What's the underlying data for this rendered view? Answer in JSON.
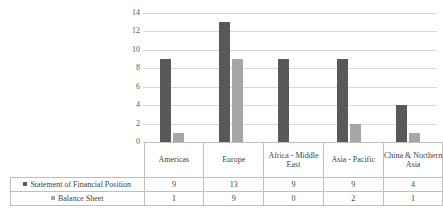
{
  "chart_data": {
    "type": "bar",
    "title": "",
    "subtitle": "",
    "xlabel": "",
    "ylabel": "",
    "categories": [
      "Americas",
      "Europe",
      "Africa - Middle East",
      "Asia - Pacific",
      "China & Northern Asia"
    ],
    "series": [
      {
        "name": "Statement of Financial Position",
        "values": [
          9,
          13,
          9,
          9,
          4
        ],
        "color": "#595959"
      },
      {
        "name": "Balance Sheet",
        "values": [
          1,
          9,
          0,
          2,
          1
        ],
        "color": "#a6a6a6"
      }
    ],
    "ylim": [
      0,
      14
    ],
    "yticks": [
      14,
      12,
      10,
      8,
      6,
      4,
      2,
      0
    ],
    "grid": true,
    "legend_position": "table-left",
    "has_data_table": true
  },
  "axis": {
    "ticks": [
      "14",
      "12",
      "10",
      "8",
      "6",
      "4",
      "2",
      "0"
    ]
  },
  "table": {
    "headers": [
      "Americas",
      "Europe",
      "Africa - Middle East",
      "Asia - Pacific",
      "China & Northern Asia"
    ],
    "rows": [
      {
        "label": "Statement of Financial Position",
        "values": [
          "9",
          "13",
          "9",
          "9",
          "4"
        ]
      },
      {
        "label": "Balance Sheet",
        "values": [
          "1",
          "9",
          "0",
          "2",
          "1"
        ]
      }
    ]
  },
  "colors": {
    "series1": "#595959",
    "series2": "#a6a6a6",
    "gridline": "#d9d9d9",
    "border": "#bfbfbf",
    "text": "#3f3f3f"
  }
}
